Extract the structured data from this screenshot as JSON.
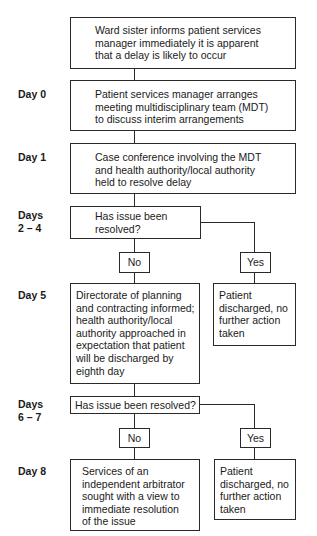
{
  "day_labels": {
    "day0": "Day 0",
    "day1": "Day 1",
    "days2_4": "Days\n2 – 4",
    "day5": "Day 5",
    "days6_7": "Days\n6 – 7",
    "day8": "Day 8"
  },
  "boxes": {
    "start": "Ward sister informs patient services\nmanager immediately it is apparent\nthat a delay is likely to occur",
    "day0": "Patient services manager arranges\nmeeting multidisciplinary team (MDT)\nto discuss interim arrangements",
    "day1": "Case conference involving the MDT\nand health authority/local authority\nheld to resolve delay",
    "decision1": "Has issue been\nresolved?",
    "no1": "No",
    "yes1": "Yes",
    "day5": "Directorate of planning\nand contracting informed;\nhealth authority/local\nauthority approached in\nexpectation that patient\nwill be discharged by\neighth day",
    "outcome1": "Patient\ndischarged, no\nfurther action\ntaken",
    "decision2": "Has issue been resolved?",
    "no2": "No",
    "yes2": "Yes",
    "day8": "Services of an\nindependent arbitrator\nsought with a view to\nimmediate resolution\nof the issue",
    "outcome2": "Patient\ndischarged, no\nfurther action\ntaken"
  }
}
